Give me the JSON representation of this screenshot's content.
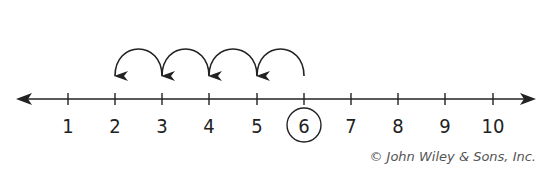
{
  "diagram": {
    "type": "number-line",
    "ticks": [
      "1",
      "2",
      "3",
      "4",
      "5",
      "6",
      "7",
      "8",
      "9",
      "10"
    ],
    "circled_value": "6",
    "hops": [
      {
        "from": "6",
        "to": "5"
      },
      {
        "from": "5",
        "to": "4"
      },
      {
        "from": "4",
        "to": "3"
      },
      {
        "from": "3",
        "to": "2"
      }
    ],
    "line_color": "#222222"
  },
  "credit": "© John Wiley & Sons, Inc."
}
